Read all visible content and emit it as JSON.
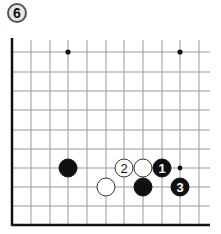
{
  "diagram": {
    "number_label": "6",
    "board": {
      "columns_x": [
        12,
        31,
        50,
        68,
        87,
        106,
        124,
        143,
        162,
        180,
        199
      ],
      "rows_y": [
        52,
        72,
        91,
        110,
        130,
        149,
        168,
        187,
        206
      ],
      "bottom_edge_y": 225,
      "left_edge_x": 12,
      "right_extent_x": 210,
      "top_extent_y": 40,
      "line_color": "#9a9a9a",
      "edge_color": "#111111"
    },
    "star_points": [
      {
        "x": 68,
        "y": 52
      },
      {
        "x": 180,
        "y": 52
      }
    ],
    "stones": [
      {
        "color": "black",
        "x": 68,
        "y": 168,
        "label": ""
      },
      {
        "color": "white",
        "x": 124,
        "y": 168,
        "label": "2"
      },
      {
        "color": "white",
        "x": 143,
        "y": 168,
        "label": ""
      },
      {
        "color": "black",
        "x": 162,
        "y": 168,
        "label": "1"
      },
      {
        "color": "white",
        "x": 106,
        "y": 187,
        "label": ""
      },
      {
        "color": "black",
        "x": 143,
        "y": 187,
        "label": ""
      },
      {
        "color": "black",
        "x": 180,
        "y": 187,
        "label": "3"
      }
    ],
    "markers": [
      {
        "type": "dot",
        "x": 180,
        "y": 168
      }
    ],
    "stone_radius": 9
  }
}
